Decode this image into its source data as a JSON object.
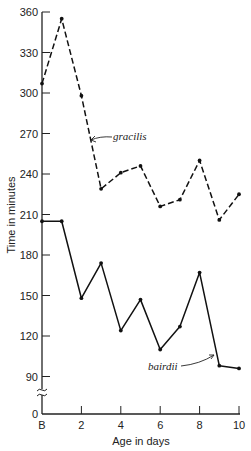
{
  "chart_data": {
    "type": "line",
    "title": "",
    "xlabel": "Age in days",
    "ylabel": "Time in minutes",
    "x": [
      "B",
      1,
      2,
      3,
      4,
      5,
      6,
      7,
      8,
      9,
      10
    ],
    "x_tick_labels": [
      "B",
      "2",
      "4",
      "6",
      "8",
      "10"
    ],
    "y_tick_labels": [
      "0",
      "90",
      "120",
      "150",
      "180",
      "210",
      "240",
      "270",
      "300",
      "330",
      "360"
    ],
    "ylim": [
      0,
      360
    ],
    "y_axis_break": "between 0 and 90",
    "grid": false,
    "legend": "inline labels with arrows",
    "series": [
      {
        "name": "gracilis",
        "style": "dashed",
        "values": [
          307,
          355,
          298,
          229,
          241,
          246,
          216,
          221,
          250,
          206,
          225
        ]
      },
      {
        "name": "bairdii",
        "style": "solid",
        "values": [
          205,
          205,
          148,
          174,
          124,
          147,
          110,
          127,
          167,
          98,
          96
        ]
      }
    ]
  },
  "labels": {
    "xlabel": "Age in days",
    "ylabel": "Time in minutes",
    "gracilis": "gracilis",
    "bairdii": "bairdii"
  }
}
